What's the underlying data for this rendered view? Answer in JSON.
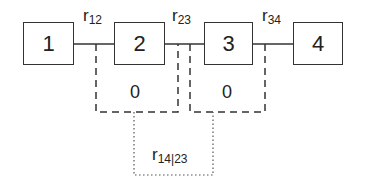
{
  "diagram": {
    "nodes": [
      {
        "id": "1",
        "label": "1"
      },
      {
        "id": "2",
        "label": "2"
      },
      {
        "id": "3",
        "label": "3"
      },
      {
        "id": "4",
        "label": "4"
      }
    ],
    "edge_labels": [
      {
        "base": "r",
        "sub": "12"
      },
      {
        "base": "r",
        "sub": "23"
      },
      {
        "base": "r",
        "sub": "34"
      }
    ],
    "dashed_groups": [
      {
        "value": "0"
      },
      {
        "value": "0"
      }
    ],
    "partial": {
      "base": "r",
      "sub": "14|23"
    },
    "colors": {
      "stroke": "#333333",
      "text": "#222222",
      "background": "#ffffff"
    }
  }
}
